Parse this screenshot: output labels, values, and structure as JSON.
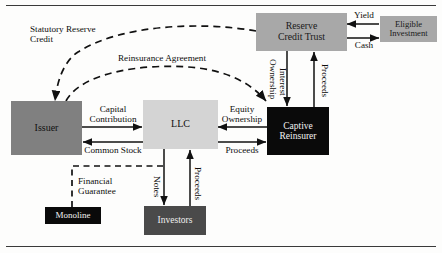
{
  "diagram": {
    "nodes": [
      {
        "id": "issuer",
        "label": "Issuer",
        "fill": "#808080",
        "text_color": "#111111"
      },
      {
        "id": "llc",
        "label": "LLC",
        "fill": "#d4d4d4",
        "text_color": "#101010"
      },
      {
        "id": "captive",
        "label_line1": "Captive",
        "label_line2": "Reinsurer",
        "fill": "#0a0a0a",
        "text_color": "#f2f2f2"
      },
      {
        "id": "reserve_trust",
        "label_line1": "Reserve",
        "label_line2": "Credit Trust",
        "fill": "#a8a8a8",
        "text_color": "#1a1a1a"
      },
      {
        "id": "eligible_invest",
        "label_line1": "Eligible",
        "label_line2": "Investment",
        "fill": "#a8a8a8",
        "text_color": "#1a1a1a"
      },
      {
        "id": "monoline",
        "label": "Monoline",
        "fill": "#0a0a0a",
        "text_color": "#f2f2f2"
      },
      {
        "id": "investors",
        "label": "Investors",
        "fill": "#4a4a4a",
        "text_color": "#f0f0f0"
      }
    ],
    "edge_labels": {
      "statutory_reserve_credit_l1": "Statutory Reserve",
      "statutory_reserve_credit_l2": "Credit",
      "reinsurance_agreement": "Reinsurance Agreement",
      "capital_contribution_l1": "Capital",
      "capital_contribution_l2": "Contribution",
      "common_stock": "Common Stock",
      "equity_ownership_l1": "Equity",
      "equity_ownership_l2": "Ownership",
      "proceeds_llc_captive": "Proceeds",
      "ownership_interest_l1": "Ownership",
      "ownership_interest_l2": "Interest",
      "proceeds_captive_trust": "Proceeds",
      "yield": "Yield",
      "cash": "Cash",
      "notes": "Notes",
      "proceeds_investors": "Proceeds",
      "financial_guarantee_l1": "Financial",
      "financial_guarantee_l2": "Guarantee"
    },
    "colors": {
      "stroke": "#111111",
      "dashed_stroke": "#111111",
      "rule": "#3a3a3a",
      "background": "#fdfdfc"
    }
  }
}
